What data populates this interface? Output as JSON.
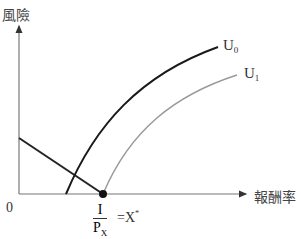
{
  "diagram": {
    "y_axis_label": "風險",
    "x_axis_label": "報酬率",
    "origin_label": "0",
    "curves": [
      {
        "name": "U",
        "sub": "0",
        "color": "#1a1a1a"
      },
      {
        "name": "U",
        "sub": "1",
        "color": "#999999"
      }
    ],
    "point_label": {
      "numerator": "I",
      "denominator": "P",
      "denominator_sub": "X",
      "equals": "=X",
      "superscript": "*"
    }
  }
}
